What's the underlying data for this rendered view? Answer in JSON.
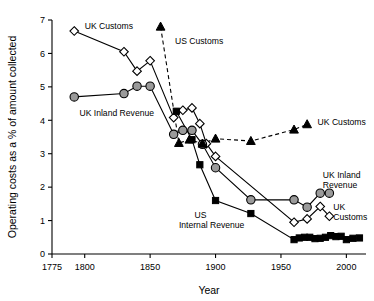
{
  "chart_data": {
    "type": "line",
    "title": "",
    "xlabel": "Year",
    "ylabel": "Operating costs as a % of amount collected",
    "xlim": [
      1775,
      2015
    ],
    "ylim": [
      0,
      7
    ],
    "xticks": [
      1775,
      1800,
      1850,
      1900,
      1950,
      2000
    ],
    "xticklabels": [
      "1775",
      "1800",
      "1850",
      "1900",
      "1950",
      "2000"
    ],
    "yticks": [
      0,
      1,
      2,
      3,
      4,
      5,
      6,
      7
    ],
    "yticklabels": [
      "0",
      "1",
      "2",
      "3",
      "4",
      "5",
      "6",
      "7"
    ],
    "grid": false,
    "legend": "inline-annotations",
    "series": [
      {
        "name": "UK Customs (early)",
        "label": "UK Customs",
        "marker": "open-diamond",
        "line": "solid",
        "color": "#ffffff",
        "points": [
          {
            "x": 1792,
            "y": 6.67
          },
          {
            "x": 1830,
            "y": 6.05
          },
          {
            "x": 1840,
            "y": 5.47
          },
          {
            "x": 1850,
            "y": 5.78
          },
          {
            "x": 1868,
            "y": 4.08
          },
          {
            "x": 1875,
            "y": 4.3
          },
          {
            "x": 1882,
            "y": 4.37
          },
          {
            "x": 1888,
            "y": 3.9
          },
          {
            "x": 1893,
            "y": 3.3
          },
          {
            "x": 1900,
            "y": 2.92
          },
          {
            "x": 1960,
            "y": 0.95
          },
          {
            "x": 1970,
            "y": 1.05
          },
          {
            "x": 1980,
            "y": 1.42
          },
          {
            "x": 1987,
            "y": 1.13
          }
        ]
      },
      {
        "name": "UK Inland Revenue",
        "label": "UK Inland Revenue",
        "marker": "filled-circle",
        "line": "solid",
        "color": "#9a9a9a",
        "points": [
          {
            "x": 1792,
            "y": 4.7
          },
          {
            "x": 1830,
            "y": 4.8
          },
          {
            "x": 1840,
            "y": 5.02
          },
          {
            "x": 1850,
            "y": 5.02
          },
          {
            "x": 1868,
            "y": 3.58
          },
          {
            "x": 1875,
            "y": 3.7
          },
          {
            "x": 1882,
            "y": 3.7
          },
          {
            "x": 1890,
            "y": 3.28
          },
          {
            "x": 1900,
            "y": 2.58
          },
          {
            "x": 1927,
            "y": 1.62
          },
          {
            "x": 1960,
            "y": 1.62
          },
          {
            "x": 1970,
            "y": 1.4
          },
          {
            "x": 1980,
            "y": 1.82
          },
          {
            "x": 1987,
            "y": 1.82
          }
        ]
      },
      {
        "name": "US Customs",
        "label": "US Customs",
        "marker": "filled-triangle",
        "line": "dashed",
        "color": "#000000",
        "points": [
          {
            "x": 1858,
            "y": 6.8
          },
          {
            "x": 1872,
            "y": 3.32
          },
          {
            "x": 1880,
            "y": 3.42
          },
          {
            "x": 1890,
            "y": 3.3
          },
          {
            "x": 1900,
            "y": 3.45
          },
          {
            "x": 1927,
            "y": 3.38
          },
          {
            "x": 1960,
            "y": 3.72
          },
          {
            "x": 1970,
            "y": 3.88
          }
        ]
      },
      {
        "name": "UK Customs (late)",
        "label": "UK Customs",
        "marker": "filled-triangle",
        "line": "dashed",
        "color": "#000000",
        "points": []
      },
      {
        "name": "US Internal Revenue",
        "label": "US Internal Revenue",
        "marker": "filled-square",
        "line": "solid",
        "color": "#000000",
        "points": [
          {
            "x": 1870,
            "y": 4.27
          },
          {
            "x": 1882,
            "y": 3.42
          },
          {
            "x": 1888,
            "y": 2.67
          },
          {
            "x": 1900,
            "y": 1.6
          },
          {
            "x": 1927,
            "y": 1.21
          },
          {
            "x": 1960,
            "y": 0.43
          },
          {
            "x": 1964,
            "y": 0.48
          },
          {
            "x": 1968,
            "y": 0.5
          },
          {
            "x": 1972,
            "y": 0.5
          },
          {
            "x": 1976,
            "y": 0.46
          },
          {
            "x": 1980,
            "y": 0.47
          },
          {
            "x": 1984,
            "y": 0.5
          },
          {
            "x": 1988,
            "y": 0.55
          },
          {
            "x": 1992,
            "y": 0.52
          },
          {
            "x": 1996,
            "y": 0.53
          },
          {
            "x": 2000,
            "y": 0.43
          },
          {
            "x": 2005,
            "y": 0.47
          },
          {
            "x": 2010,
            "y": 0.48
          }
        ]
      }
    ],
    "annotations": [
      {
        "id": "ann-uk-customs-top",
        "text": "UK Customs",
        "x": 1800,
        "y": 6.72,
        "anchor": "start"
      },
      {
        "id": "ann-us-customs",
        "text": "US Customs",
        "x": 1869,
        "y": 6.28,
        "anchor": "start"
      },
      {
        "id": "ann-uk-inland-left",
        "text": "UK Inland Revenue",
        "x": 1796,
        "y": 4.12,
        "anchor": "start"
      },
      {
        "id": "ann-uk-customs-right",
        "text": "UK Customs",
        "x": 1978,
        "y": 3.85,
        "anchor": "start"
      },
      {
        "id": "ann-uk-inland-r1",
        "text": "UK Inland",
        "x": 1982,
        "y": 2.28,
        "anchor": "start"
      },
      {
        "id": "ann-uk-inland-r2",
        "text": "Revenue",
        "x": 1982,
        "y": 1.96,
        "anchor": "start"
      },
      {
        "id": "ann-uk-customs-r1",
        "text": "UK",
        "x": 1990,
        "y": 1.33,
        "anchor": "start"
      },
      {
        "id": "ann-uk-customs-r2",
        "text": "Customs",
        "x": 1990,
        "y": 1.02,
        "anchor": "start"
      },
      {
        "id": "ann-us-ir-1",
        "text": "US",
        "x": 1884,
        "y": 1.08,
        "anchor": "start"
      },
      {
        "id": "ann-us-ir-2",
        "text": "Internal Revenue",
        "x": 1872,
        "y": 0.78,
        "anchor": "start"
      }
    ]
  }
}
